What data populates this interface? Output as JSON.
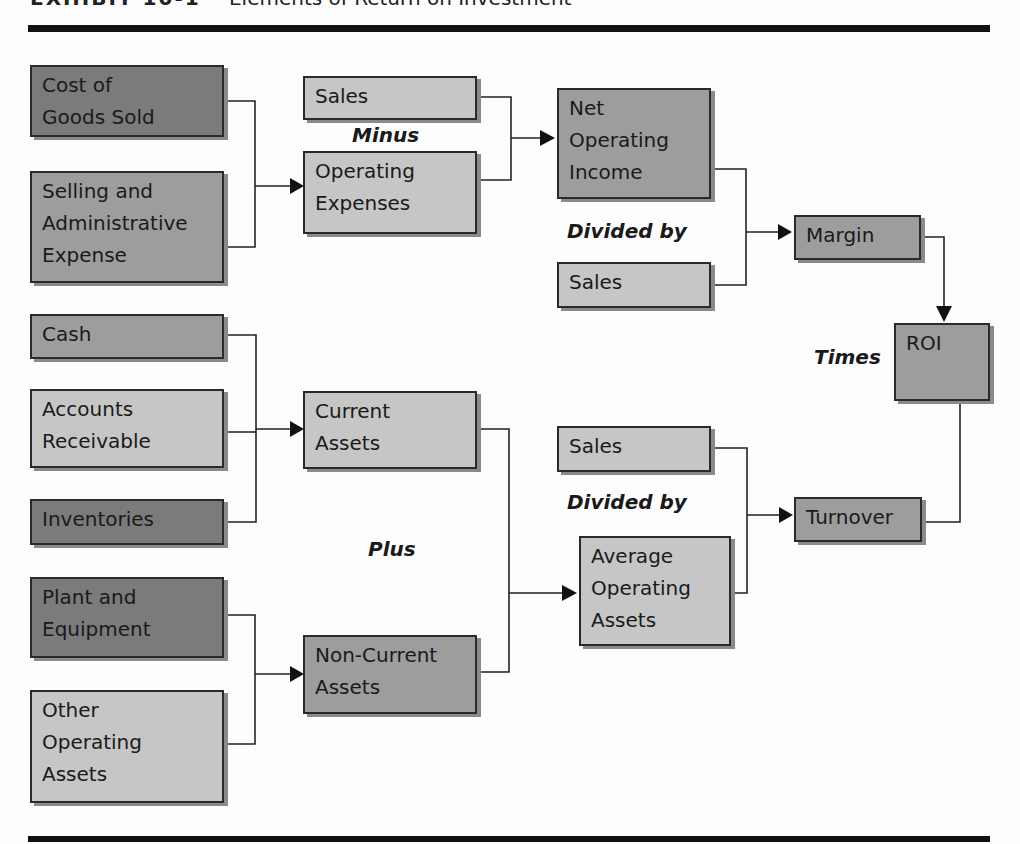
{
  "title": {
    "exhibit": "EXHIBIT 10-1",
    "text": "Elements of Return on Investment"
  },
  "boxes": {
    "cogs": "Cost of\nGoods Sold",
    "sga": "Selling and\nAdministrative\nExpense",
    "sales_top": "Sales",
    "opex": "Operating\nExpenses",
    "noi": "Net\nOperating\nIncome",
    "sales_mid": "Sales",
    "margin": "Margin",
    "roi": "ROI",
    "cash": "Cash",
    "ar": "Accounts\nReceivable",
    "inventories": "Inventories",
    "current_assets": "Current\nAssets",
    "sales_bottom": "Sales",
    "turnover": "Turnover",
    "plant": "Plant and\nEquipment",
    "other_assets": "Other\nOperating\nAssets",
    "noncurrent_assets": "Non-Current\nAssets",
    "avg_assets": "Average\nOperating\nAssets"
  },
  "operators": {
    "minus": "Minus",
    "divided_by_top": "Divided by",
    "times": "Times",
    "plus": "Plus",
    "divided_by_bottom": "Divided by"
  },
  "colors": {
    "dark_fill": "#7b7b7b",
    "medium_fill": "#9d9d9d",
    "light_fill": "#c6c6c6",
    "rule": "#111111"
  }
}
